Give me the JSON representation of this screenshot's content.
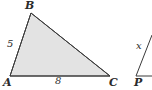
{
  "figure": {
    "background_color": "#ffffff",
    "stroke_color": "#3a3a3a",
    "fill_color": "#e3e3e3",
    "label_color": "#2b2b2b",
    "primary_triangle": {
      "name": "triangle-abc",
      "filled": true,
      "vertices": [
        {
          "label": "B",
          "x": 31,
          "y": 13
        },
        {
          "label": "C",
          "x": 110,
          "y": 76
        },
        {
          "label": "A",
          "x": 10,
          "y": 76
        }
      ],
      "vertex_labels": {
        "a": "A",
        "b": "B",
        "c": "C"
      },
      "side_labels": {
        "ab": "5",
        "ac": "8"
      }
    },
    "secondary_triangle": {
      "name": "triangle-p-cropped",
      "filled": false,
      "cropped": true,
      "vertices": [
        {
          "label": "P",
          "x": 136,
          "y": 76
        },
        {
          "label": "",
          "x": 152,
          "y": 36
        },
        {
          "label": "",
          "x": 152,
          "y": 76
        }
      ],
      "vertex_labels": {
        "p": "P"
      },
      "side_labels": {
        "x": "x"
      }
    }
  }
}
